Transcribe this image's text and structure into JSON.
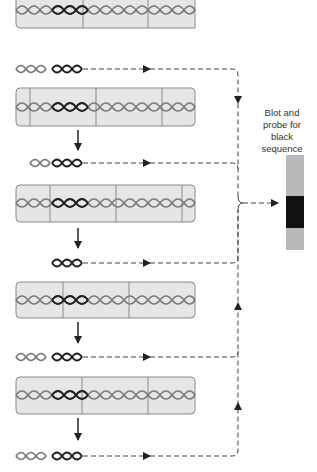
{
  "diagram": {
    "label_lines": [
      "Blot and",
      "probe for",
      "black",
      "sequence"
    ],
    "colors": {
      "cell_fill": "#e6e6e6",
      "cell_border": "#8a8a8a",
      "strand_gray": "#7a7a7a",
      "strand_black": "#222222",
      "dash": "#444444",
      "gel_gray": "#b8b8b8",
      "gel_band": "#111111"
    },
    "strips": [
      {
        "y": 0,
        "h": 28,
        "dividers": [
          83,
          148
        ]
      },
      {
        "y": 88,
        "h": 38,
        "dividers": [
          30,
          96,
          162
        ]
      },
      {
        "y": 185,
        "h": 37,
        "dividers": [
          50,
          116,
          182
        ]
      },
      {
        "y": 282,
        "h": 36,
        "dividers": [
          63,
          129
        ]
      },
      {
        "y": 377,
        "h": 37,
        "dividers": [
          82,
          148
        ]
      }
    ],
    "fragments": [
      {
        "y": 69,
        "label": "fragment-1"
      },
      {
        "y": 163,
        "label": "fragment-2"
      },
      {
        "y": 263,
        "label": "fragment-3"
      },
      {
        "y": 357,
        "label": "fragment-4"
      },
      {
        "y": 456,
        "label": "fragment-5"
      }
    ],
    "gel": {
      "x": 286,
      "y": 155,
      "w": 18,
      "h": 95,
      "band_y": 196,
      "band_h": 32
    }
  }
}
